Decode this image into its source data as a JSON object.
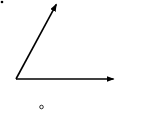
{
  "diagram": {
    "type": "angle",
    "colors": {
      "stroke": "#000000",
      "background": "#ffffff"
    },
    "vertex": {
      "x": 16,
      "y": 79
    },
    "rays": [
      {
        "name": "upper-ray",
        "end": {
          "x": 57,
          "y": 3
        }
      },
      {
        "name": "horizontal-ray",
        "end": {
          "x": 115,
          "y": 79
        }
      }
    ],
    "marks": {
      "corner_dot": "•",
      "degree_symbol": "°"
    }
  }
}
